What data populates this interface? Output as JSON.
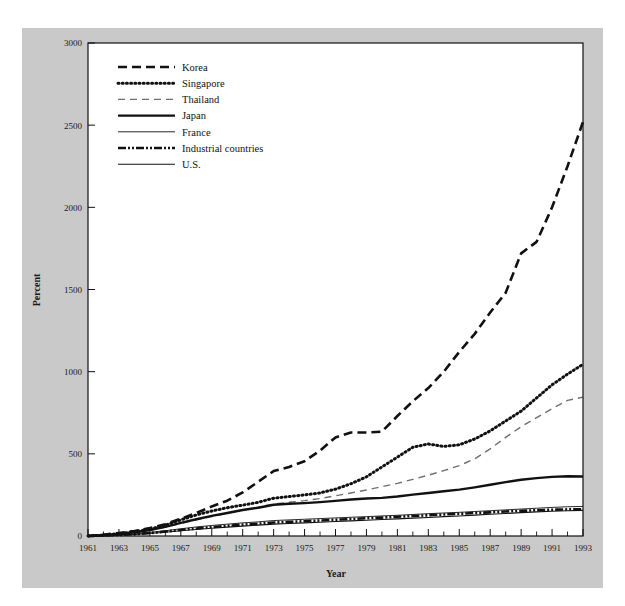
{
  "figure": {
    "background_color": "#ffffff",
    "panel_color": "#c9c9c9",
    "plot_background_color": "#ffffff",
    "line_color": "#111111"
  },
  "chart_data": {
    "type": "line",
    "title": "",
    "subtitle": "",
    "xlabel": "Year",
    "ylabel": "Percent",
    "xlim": [
      1961,
      1993
    ],
    "ylim": [
      0,
      3000
    ],
    "grid": false,
    "legend_position": "upper-left-inside",
    "y_ticks": [
      0,
      500,
      1000,
      1500,
      2000,
      2500,
      3000
    ],
    "y_tick_labels": [
      "0",
      "500",
      "1000",
      "1500",
      "2000",
      "2500",
      "3000"
    ],
    "x_ticks": [
      1961,
      1963,
      1965,
      1967,
      1969,
      1971,
      1973,
      1975,
      1977,
      1979,
      1981,
      1983,
      1985,
      1987,
      1989,
      1991,
      1993
    ],
    "x_tick_labels": [
      "1961",
      "1963",
      "1965",
      "1967",
      "1969",
      "1971",
      "1973",
      "1975",
      "1977",
      "1979",
      "1981",
      "1983",
      "1985",
      "1987",
      "1989",
      "1991",
      "1993"
    ],
    "x_minor_ticks": [
      1962,
      1964,
      1966,
      1968,
      1970,
      1972,
      1974,
      1976,
      1978,
      1980,
      1982,
      1984,
      1986,
      1988,
      1990,
      1992
    ],
    "x": [
      1961,
      1962,
      1963,
      1964,
      1965,
      1966,
      1967,
      1968,
      1969,
      1970,
      1971,
      1972,
      1973,
      1974,
      1975,
      1976,
      1977,
      1978,
      1979,
      1980,
      1981,
      1982,
      1983,
      1984,
      1985,
      1986,
      1987,
      1988,
      1989,
      1990,
      1991,
      1992,
      1993
    ],
    "series": [
      {
        "name": "Korea",
        "style": "dashed",
        "stroke_width": 2.6,
        "dasharray": "9,5",
        "color": "#111111",
        "values": [
          0,
          8,
          18,
          30,
          48,
          72,
          105,
          140,
          180,
          215,
          265,
          330,
          395,
          420,
          455,
          520,
          600,
          630,
          630,
          635,
          730,
          820,
          900,
          1000,
          1120,
          1230,
          1360,
          1480,
          1720,
          1790,
          2000,
          2250,
          2520
        ]
      },
      {
        "name": "Singapore",
        "style": "dotted",
        "stroke_width": 3.0,
        "dasharray": "1,3.2",
        "color": "#111111",
        "values": [
          0,
          6,
          14,
          26,
          42,
          66,
          98,
          128,
          152,
          172,
          188,
          205,
          230,
          240,
          250,
          262,
          285,
          318,
          360,
          420,
          480,
          540,
          560,
          545,
          555,
          590,
          640,
          700,
          760,
          840,
          920,
          985,
          1045
        ]
      },
      {
        "name": "Thailand",
        "style": "dashed-light",
        "stroke_width": 1.4,
        "dasharray": "7,5",
        "color": "#6f6f6f",
        "values": [
          0,
          4,
          10,
          20,
          34,
          54,
          76,
          98,
          118,
          138,
          158,
          175,
          195,
          205,
          215,
          228,
          245,
          262,
          280,
          300,
          320,
          345,
          370,
          398,
          428,
          470,
          530,
          600,
          665,
          720,
          775,
          825,
          845
        ]
      },
      {
        "name": "Japan",
        "style": "solid-thick",
        "stroke_width": 2.4,
        "dasharray": "",
        "color": "#111111",
        "values": [
          0,
          5,
          12,
          22,
          36,
          56,
          80,
          102,
          122,
          140,
          158,
          172,
          190,
          196,
          200,
          206,
          214,
          222,
          228,
          232,
          240,
          252,
          262,
          272,
          282,
          296,
          312,
          328,
          342,
          352,
          360,
          364,
          362
        ]
      },
      {
        "name": "France",
        "style": "solid-thin",
        "stroke_width": 0.9,
        "dasharray": "",
        "color": "#111111",
        "values": [
          0,
          3,
          7,
          13,
          22,
          32,
          44,
          55,
          64,
          72,
          80,
          86,
          94,
          98,
          102,
          106,
          110,
          114,
          118,
          122,
          126,
          131,
          136,
          140,
          144,
          149,
          154,
          159,
          164,
          169,
          174,
          178,
          180
        ]
      },
      {
        "name": "Industrial countries",
        "style": "dash-dot-thick",
        "stroke_width": 2.6,
        "dasharray": "8,2,2,2,2,2",
        "color": "#111111",
        "values": [
          0,
          3,
          6,
          11,
          18,
          27,
          37,
          46,
          54,
          62,
          69,
          75,
          82,
          86,
          90,
          94,
          99,
          103,
          108,
          112,
          117,
          122,
          126,
          131,
          135,
          140,
          144,
          149,
          153,
          157,
          160,
          162,
          163
        ]
      },
      {
        "name": "U.S.",
        "style": "solid-thin",
        "stroke_width": 1.1,
        "dasharray": "",
        "color": "#111111",
        "values": [
          0,
          2,
          5,
          9,
          15,
          23,
          32,
          40,
          47,
          54,
          60,
          66,
          72,
          76,
          80,
          84,
          88,
          92,
          96,
          100,
          104,
          109,
          113,
          118,
          122,
          127,
          132,
          137,
          142,
          147,
          151,
          154,
          156
        ]
      }
    ],
    "legend_entries": [
      {
        "label": "Korea",
        "style": "dashed"
      },
      {
        "label": "Singapore",
        "style": "dotted"
      },
      {
        "label": "Thailand",
        "style": "dashed-light"
      },
      {
        "label": "Japan",
        "style": "solid-thick"
      },
      {
        "label": "France",
        "style": "solid-thin"
      },
      {
        "label": "Industrial countries",
        "style": "dash-dot-thick"
      },
      {
        "label": "U.S.",
        "style": "solid-thin"
      }
    ]
  }
}
